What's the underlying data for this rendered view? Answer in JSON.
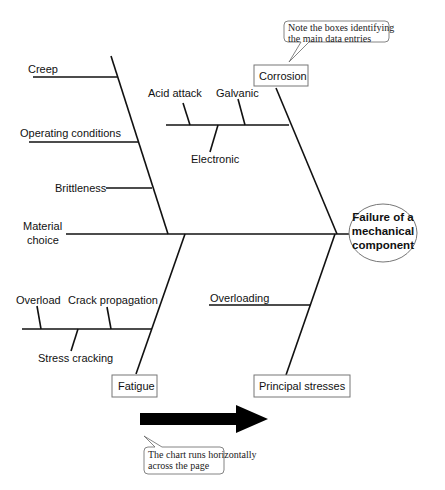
{
  "effect": {
    "lines": [
      "Failure of a",
      "mechanical",
      "component"
    ]
  },
  "categories": {
    "corrosion": "Corrosion",
    "fatigue": "Fatigue",
    "principal_stresses": "Principal stresses"
  },
  "causes": {
    "creep": "Creep",
    "operating_conditions": "Operating conditions",
    "brittleness": "Brittleness",
    "material_choice": [
      "Material",
      "choice"
    ],
    "acid_attack": "Acid attack",
    "galvanic": "Galvanic",
    "electronic": "Electronic",
    "overload": "Overload",
    "crack_propagation": "Crack propagation",
    "stress_cracking": "Stress cracking",
    "overloading": "Overloading"
  },
  "callouts": {
    "top": [
      "Note the boxes identifying",
      "the main data entries"
    ],
    "bottom": [
      "The chart runs horizontally",
      "across the page"
    ]
  },
  "colors": {
    "line": "#111111",
    "box_border": "#777777",
    "arrow": "#000000"
  }
}
